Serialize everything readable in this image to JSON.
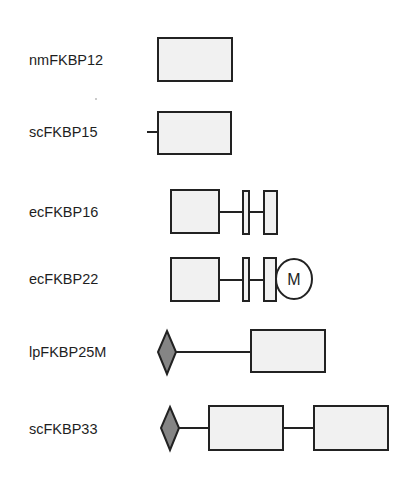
{
  "diagram": {
    "proteins": [
      {
        "name": "nmFKBP12",
        "label_y": 52
      },
      {
        "name": "scFKBP15",
        "label_y": 124
      },
      {
        "name": "ecFKBP16",
        "label_y": 204
      },
      {
        "name": "ecFKBP22",
        "label_y": 271
      },
      {
        "name": "lpFKBP25M",
        "label_y": 344
      },
      {
        "name": "scFKBP33",
        "label_y": 421
      }
    ],
    "domain_labels": {
      "membrane_circle": "M"
    },
    "colors": {
      "domain_fill": "#f1f1f1",
      "stroke": "#222222",
      "diamond_fill": "#858585",
      "background": "#ffffff"
    }
  }
}
